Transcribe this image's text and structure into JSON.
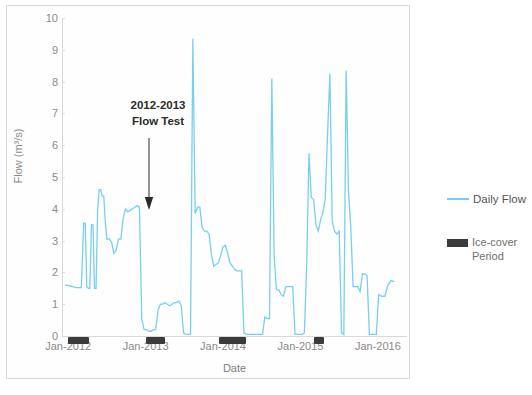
{
  "chart_data": {
    "type": "line",
    "title": "",
    "xlabel": "Date",
    "ylabel": "Flow (m³/s)",
    "ylim": [
      0,
      10
    ],
    "yticks": [
      0,
      1,
      2,
      3,
      4,
      5,
      6,
      7,
      8,
      9,
      10
    ],
    "xtick_labels": [
      "Jan-2012",
      "Jan-2013",
      "Jan-2014",
      "Jan-2015",
      "Jan-2016"
    ],
    "xtick_values": [
      2012.0,
      2013.0,
      2014.0,
      2015.0,
      2016.0
    ],
    "xlim": [
      2011.92,
      2016.35
    ],
    "grid": false,
    "legend_position": "right",
    "series": [
      {
        "name": "Daily Flow",
        "color": "#77d0ef",
        "x": [
          2011.96,
          2012.02,
          2012.06,
          2012.1,
          2012.14,
          2012.17,
          2012.2,
          2012.22,
          2012.24,
          2012.26,
          2012.28,
          2012.3,
          2012.32,
          2012.34,
          2012.36,
          2012.38,
          2012.4,
          2012.42,
          2012.44,
          2012.46,
          2012.48,
          2012.5,
          2012.53,
          2012.56,
          2012.59,
          2012.62,
          2012.65,
          2012.68,
          2012.71,
          2012.74,
          2012.77,
          2012.8,
          2012.83,
          2012.86,
          2012.89,
          2012.92,
          2012.95,
          2012.98,
          2013.01,
          2013.04,
          2013.07,
          2013.1,
          2013.13,
          2013.16,
          2013.19,
          2013.22,
          2013.25,
          2013.28,
          2013.31,
          2013.34,
          2013.37,
          2013.4,
          2013.43,
          2013.46,
          2013.49,
          2013.52,
          2013.55,
          2013.58,
          2013.61,
          2013.64,
          2013.67,
          2013.7,
          2013.73,
          2013.76,
          2013.79,
          2013.82,
          2013.85,
          2013.88,
          2013.91,
          2013.94,
          2013.97,
          2014.0,
          2014.03,
          2014.06,
          2014.09,
          2014.12,
          2014.15,
          2014.18,
          2014.21,
          2014.24,
          2014.27,
          2014.3,
          2014.33,
          2014.36,
          2014.39,
          2014.42,
          2014.45,
          2014.48,
          2014.51,
          2014.54,
          2014.57,
          2014.6,
          2014.63,
          2014.66,
          2014.69,
          2014.72,
          2014.75,
          2014.78,
          2014.81,
          2014.84,
          2014.87,
          2014.9,
          2014.93,
          2014.96,
          2014.99,
          2015.02,
          2015.05,
          2015.08,
          2015.11,
          2015.14,
          2015.17,
          2015.2,
          2015.23,
          2015.26,
          2015.29,
          2015.32,
          2015.35,
          2015.38,
          2015.41,
          2015.44,
          2015.47,
          2015.5,
          2015.53,
          2015.56,
          2015.59,
          2015.62,
          2015.65,
          2015.68,
          2015.71,
          2015.74,
          2015.77,
          2015.8,
          2015.83,
          2015.86,
          2015.89,
          2015.92,
          2015.95,
          2015.98,
          2016.01,
          2016.05,
          2016.09,
          2016.13,
          2016.17,
          2016.21
        ],
        "values": [
          1.6,
          1.58,
          1.55,
          1.52,
          1.52,
          1.52,
          3.55,
          3.55,
          1.55,
          1.5,
          1.5,
          3.5,
          3.5,
          1.5,
          1.5,
          3.95,
          4.6,
          4.6,
          4.4,
          4.4,
          3.55,
          3.05,
          3.05,
          2.95,
          2.6,
          2.7,
          3.05,
          3.05,
          3.7,
          4.0,
          3.9,
          3.95,
          4.0,
          4.05,
          4.1,
          4.05,
          0.55,
          0.2,
          0.2,
          0.15,
          0.15,
          0.2,
          0.2,
          0.8,
          1.0,
          1.0,
          1.05,
          1.0,
          0.95,
          1.0,
          1.05,
          1.05,
          1.1,
          0.95,
          0.1,
          0.05,
          0.05,
          0.05,
          9.35,
          3.85,
          4.05,
          4.05,
          3.4,
          3.3,
          3.3,
          3.2,
          2.55,
          2.2,
          2.25,
          2.3,
          2.55,
          2.8,
          2.85,
          2.6,
          2.3,
          2.2,
          2.1,
          2.05,
          2.05,
          2.05,
          0.1,
          0.05,
          0.05,
          0.05,
          0.05,
          0.05,
          0.05,
          0.05,
          0.05,
          0.6,
          0.55,
          0.55,
          8.1,
          2.5,
          1.45,
          1.45,
          1.3,
          1.25,
          1.55,
          1.55,
          1.55,
          1.55,
          0.05,
          0.05,
          0.05,
          0.05,
          0.1,
          2.2,
          5.75,
          4.35,
          4.3,
          3.5,
          3.3,
          3.65,
          3.9,
          4.3,
          6.35,
          8.25,
          3.6,
          3.3,
          3.2,
          3.3,
          0.1,
          0.05,
          8.35,
          4.55,
          3.4,
          1.55,
          1.55,
          1.55,
          1.4,
          1.95,
          1.95,
          1.9,
          0.05,
          0.05,
          0.05,
          0.05,
          1.3,
          1.25,
          1.25,
          1.6,
          1.75,
          1.7
        ]
      }
    ],
    "ice_cover_periods": [
      {
        "start": 2012.0,
        "end": 2012.27
      },
      {
        "start": 2013.0,
        "end": 2013.25
      },
      {
        "start": 2013.95,
        "end": 2014.3
      },
      {
        "start": 2015.18,
        "end": 2015.31
      }
    ],
    "annotations": [
      {
        "text": "2012-2013\nFlow Test",
        "line1": "2012-2013",
        "line2": "Flow Test",
        "target_x": 2012.88,
        "target_y": 4.05
      }
    ],
    "legend": [
      {
        "label": "Daily Flow",
        "type": "line",
        "color": "#77d0ef"
      },
      {
        "label": "Ice-cover\nPeriod",
        "type": "box",
        "color": "#3b3b3b"
      }
    ]
  }
}
